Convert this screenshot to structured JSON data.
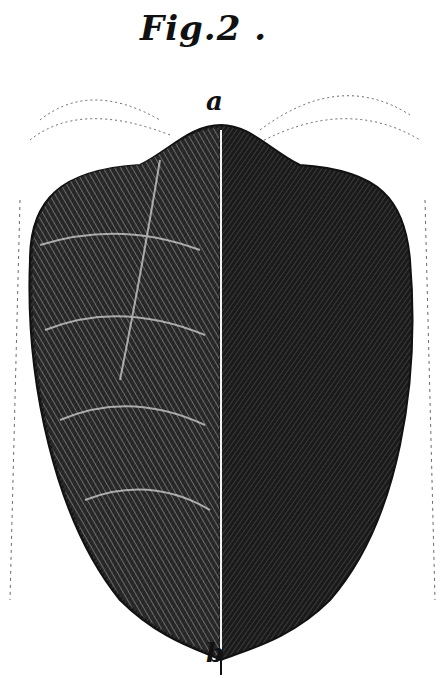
{
  "figure": {
    "title": "Fig.2 .",
    "labels": {
      "top": "a",
      "bottom": "b"
    },
    "colors": {
      "ink": "#111111",
      "paper": "#ffffff"
    }
  }
}
